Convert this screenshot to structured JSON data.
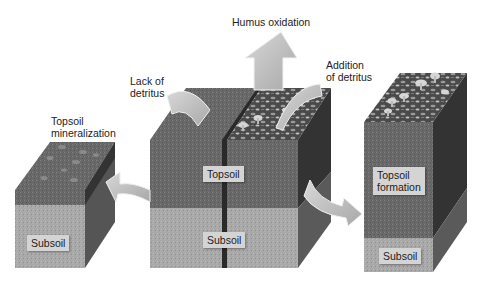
{
  "diagram": {
    "labels": {
      "humus_oxidation": "Humus oxidation",
      "lack_of_detritus": "Lack of\ndetritus",
      "addition_of_detritus": "Addition\nof detritus",
      "topsoil_mineralization": "Topsoil\nmineralization"
    },
    "blocks": [
      {
        "id": "left",
        "description": "Thin topsoil over subsoil after mineralization",
        "tags": [
          "Subsoil"
        ]
      },
      {
        "id": "center",
        "description": "Original soil column with topsoil over subsoil",
        "tags": [
          "Topsoil",
          "Subsoil"
        ]
      },
      {
        "id": "right",
        "description": "Thick topsoil with litter and mushrooms",
        "tags": [
          "Topsoil\nformation",
          "Subsoil"
        ]
      }
    ],
    "arrows": [
      {
        "id": "humus-oxidation-arrow",
        "direction": "up",
        "from": "center",
        "to": "atmosphere"
      },
      {
        "id": "lack-of-detritus-arrow",
        "direction": "down-right",
        "into": "center-left-top"
      },
      {
        "id": "addition-of-detritus-arrow",
        "direction": "down-left",
        "into": "center-right-top"
      },
      {
        "id": "mineralization-arrow",
        "direction": "left",
        "from": "center",
        "to": "left"
      },
      {
        "id": "formation-arrow",
        "direction": "right",
        "from": "center",
        "to": "right"
      }
    ],
    "colors": {
      "topsoil": "#6e6e6e",
      "topsoil_side": "#3c3c3c",
      "subsoil": "#a9a9a9",
      "subsoil_side": "#5a5a5a",
      "arrow": "#bfbfbf",
      "tag_bg": "#d4d4d4"
    }
  }
}
